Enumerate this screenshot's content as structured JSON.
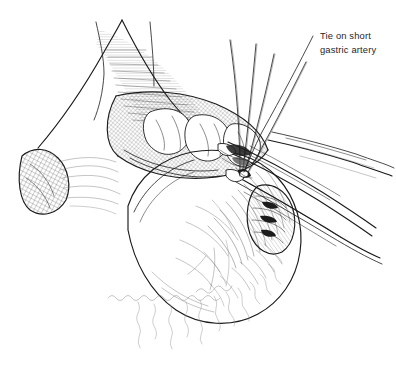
{
  "figure": {
    "title": "Tie on short gastric artery",
    "background_color": "#ffffff",
    "ink_color": "#1a1a1a",
    "width": 396,
    "height": 370,
    "medium": "pen-and-ink line drawing"
  },
  "annotations": [
    {
      "id": "short-gastric-tie",
      "line1": "Tie on short gastric artery",
      "label_line_1": "Tie on short",
      "label_line_2": "gastric artery",
      "text_color": "#262626",
      "text_x": 320,
      "text_y_line1": 38,
      "text_y_line2": 52,
      "leader_from_x": 313,
      "leader_from_y": 36,
      "leader_to_x": 243,
      "leader_to_y": 172
    }
  ],
  "structures": [
    {
      "name": "stomach-body",
      "description": "large pale rounded stomach body occupying center"
    },
    {
      "name": "greater-curvature-band",
      "description": "cross-hatched band of tissue along upper-left curvature"
    },
    {
      "name": "omental-fringe",
      "description": "wavy hanging strands of omentum in lower half"
    },
    {
      "name": "left-tissue-lobe",
      "description": "small cross-hatched lobe at far left margin"
    },
    {
      "name": "retracted-flap",
      "description": "curved retracted tissue flap with horizontal hatching at top"
    },
    {
      "name": "vessel-pedicle",
      "description": "textured vessel pedicle at right of field"
    }
  ],
  "instruments": [
    {
      "name": "suture-thread-1",
      "type": "suture"
    },
    {
      "name": "suture-thread-2",
      "type": "suture"
    },
    {
      "name": "suture-thread-3",
      "type": "suture"
    },
    {
      "name": "suture-thread-4",
      "type": "suture"
    },
    {
      "name": "clamp-upper",
      "type": "clamp"
    },
    {
      "name": "clamp-lower",
      "type": "clamp"
    },
    {
      "name": "retractor-blade",
      "type": "retractor"
    }
  ]
}
